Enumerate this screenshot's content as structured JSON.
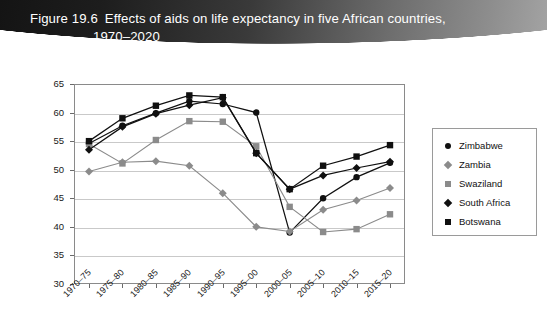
{
  "banner": {
    "figure_number": "Figure 19.6",
    "title_line1": "Effects of aids on life expectancy in five African countries,",
    "title_line2": "1970–2020"
  },
  "legend": {
    "position": "right",
    "items": [
      {
        "label": "Zimbabwe",
        "marker": "circle",
        "color": "#101010"
      },
      {
        "label": "Zambia",
        "marker": "diamond",
        "color": "#8b8b8b"
      },
      {
        "label": "Swaziland",
        "marker": "square",
        "color": "#8b8b8b"
      },
      {
        "label": "South Africa",
        "marker": "diamond",
        "color": "#101010"
      },
      {
        "label": "Botswana",
        "marker": "square",
        "color": "#101010"
      }
    ]
  },
  "axes": {
    "y_ticks": [
      "30",
      "35",
      "40",
      "45",
      "50",
      "55",
      "60",
      "65"
    ],
    "x_ticks": [
      "1970–75",
      "1975–80",
      "1980–85",
      "1985–90",
      "1990–95",
      "1995–00",
      "2000–05",
      "2005–10",
      "2010–15",
      "2015–20"
    ]
  },
  "chart_data": {
    "type": "line",
    "title": "Effects of aids on life expectancy in five African countries, 1970–2020",
    "xlabel": "",
    "ylabel": "",
    "ylim": [
      30,
      65
    ],
    "ytick_step": 5,
    "grid": true,
    "legend_position": "right",
    "categories": [
      "1970–75",
      "1975–80",
      "1980–85",
      "1985–90",
      "1990–95",
      "1995–00",
      "2000–05",
      "2005–10",
      "2010–15",
      "2015–20"
    ],
    "series": [
      {
        "name": "Zimbabwe",
        "marker": "circle",
        "color": "#101010",
        "values": [
          54.6,
          57.7,
          59.9,
          62.0,
          61.5,
          60.0,
          39.0,
          45.0,
          48.7,
          51.2
        ]
      },
      {
        "name": "Zambia",
        "marker": "diamond",
        "color": "#8b8b8b",
        "values": [
          49.7,
          51.3,
          51.5,
          50.7,
          45.9,
          40.0,
          39.2,
          43.0,
          44.6,
          46.8
        ]
      },
      {
        "name": "Swaziland",
        "marker": "square",
        "color": "#8b8b8b",
        "values": [
          54.5,
          51.1,
          55.2,
          58.5,
          58.4,
          54.1,
          43.5,
          39.1,
          39.6,
          42.2
        ]
      },
      {
        "name": "South Africa",
        "marker": "diamond",
        "color": "#101010",
        "values": [
          53.5,
          57.5,
          59.8,
          61.3,
          62.6,
          52.9,
          46.6,
          49.0,
          50.3,
          51.4
        ]
      },
      {
        "name": "Botswana",
        "marker": "square",
        "color": "#101010",
        "values": [
          55.0,
          59.0,
          61.2,
          63.0,
          62.7,
          52.9,
          46.6,
          50.7,
          52.3,
          54.3
        ]
      }
    ]
  }
}
